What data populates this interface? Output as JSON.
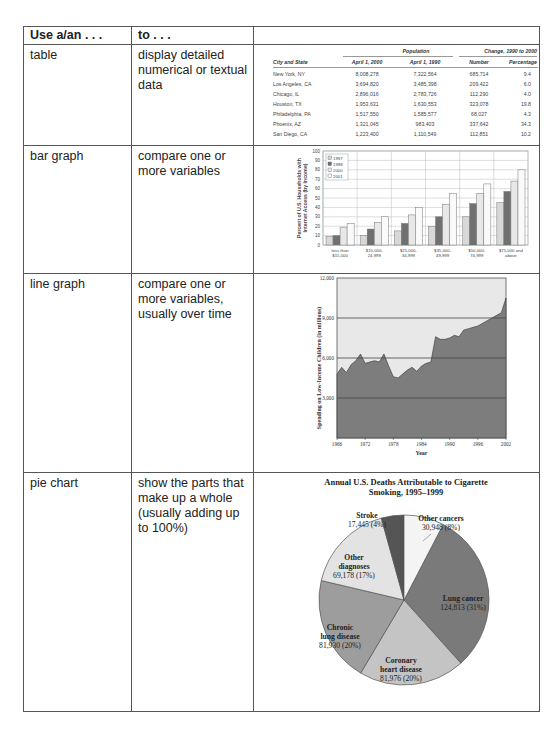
{
  "header": {
    "col1": "Use a/an . . .",
    "col2": "to . . .",
    "col3": ""
  },
  "rows": [
    {
      "use": "table",
      "to": "display detailed numerical or textual data"
    },
    {
      "use": "bar graph",
      "to": "compare one or more variables"
    },
    {
      "use": "line graph",
      "to": "compare one or more variables, usually over time"
    },
    {
      "use": "pie chart",
      "to": "show the parts that make up a whole (usually adding up to 100%)"
    }
  ],
  "example_table": {
    "group_headers": {
      "population": "Population",
      "change": "Change, 1990 to 2000"
    },
    "columns": [
      "City and State",
      "April 1, 2000",
      "April 1, 1990",
      "Number",
      "Percentage"
    ],
    "rows": [
      [
        "New York, NY",
        "8,008,278",
        "7,322,564",
        "685,714",
        "9.4"
      ],
      [
        "Los Angeles, CA",
        "3,694,820",
        "3,485,398",
        "209,422",
        "6.0"
      ],
      [
        "Chicago, IL",
        "2,896,016",
        "2,783,726",
        "112,290",
        "4.0"
      ],
      [
        "Houston, TX",
        "1,953,631",
        "1,630,553",
        "323,078",
        "19.8"
      ],
      [
        "Philadelphia, PA",
        "1,517,550",
        "1,585,577",
        "68,027",
        "4.3"
      ],
      [
        "Phoenix, AZ",
        "1,321,045",
        "983,403",
        "337,642",
        "34.3"
      ],
      [
        "San Diego, CA",
        "1,223,400",
        "1,110,549",
        "112,851",
        "10.2"
      ]
    ]
  },
  "chart_data": [
    {
      "type": "bar",
      "title": "",
      "ylabel": "Percent of U.S. Households with Internet Access (by Income)",
      "xlabel": "",
      "ylim": [
        0,
        100
      ],
      "yticks": [
        0,
        10,
        20,
        30,
        40,
        50,
        60,
        70,
        80,
        90,
        100
      ],
      "categories": [
        "less than $15,000",
        "$15,000-24,999",
        "$25,000-34,999",
        "$35,000-49,999",
        "$50,000-74,999",
        "$75,000 and above"
      ],
      "series": [
        {
          "name": "1997",
          "color": "#d8d8d8",
          "values": [
            9,
            10,
            15,
            20,
            30,
            45
          ]
        },
        {
          "name": "1998",
          "color": "#707070",
          "values": [
            10,
            17,
            23,
            30,
            44,
            57
          ]
        },
        {
          "name": "2000",
          "color": "#e8e8e8",
          "values": [
            19,
            24,
            32,
            43,
            55,
            68
          ]
        },
        {
          "name": "2001",
          "color": "#fafafa",
          "values": [
            23,
            30,
            40,
            55,
            65,
            80
          ]
        }
      ],
      "legend_position": "upper-left inside",
      "grid": true
    },
    {
      "type": "area",
      "title": "",
      "ylabel": "Spending on Low-Income Children (in millions)",
      "xlabel": "Year",
      "ylim": [
        0,
        12000
      ],
      "yticks": [
        "3,000",
        "6,000",
        "9,000",
        "12,000"
      ],
      "xticks": [
        "1966",
        "1972",
        "1978",
        "1984",
        "1990",
        "1996",
        "2002"
      ],
      "x": [
        1966,
        1967,
        1968,
        1969,
        1970,
        1971,
        1972,
        1973,
        1974,
        1975,
        1976,
        1977,
        1978,
        1979,
        1980,
        1981,
        1982,
        1983,
        1984,
        1985,
        1986,
        1987,
        1988,
        1989,
        1990,
        1991,
        1992,
        1993,
        1994,
        1995,
        1996,
        1997,
        1998,
        1999,
        2000,
        2001,
        2002
      ],
      "values": [
        4800,
        5300,
        4900,
        5500,
        5800,
        6300,
        5600,
        5700,
        5800,
        5700,
        6300,
        5400,
        4600,
        4500,
        4800,
        5100,
        5300,
        5000,
        5400,
        5600,
        5700,
        7600,
        7400,
        7400,
        7500,
        7700,
        7600,
        8100,
        8200,
        8300,
        8400,
        8600,
        8800,
        9000,
        9200,
        9400,
        10500
      ],
      "grid": true
    },
    {
      "type": "pie",
      "title": "Annual U.S. Deaths Attributable to Cigarette Smoking, 1995–1999",
      "slices": [
        {
          "label": "Lung cancer",
          "value": 124813,
          "percent": "31%",
          "display": "124,813 (31%)",
          "color": "#7a7a7a"
        },
        {
          "label": "Coronary heart disease",
          "value": 81976,
          "percent": "20%",
          "display": "81,976 (20%)",
          "color": "#c4c4c4"
        },
        {
          "label": "Chronic lung disease",
          "value": 81930,
          "percent": "20%",
          "display": "81,930 (20%)",
          "color": "#9d9d9d"
        },
        {
          "label": "Other diagnoses",
          "value": 69178,
          "percent": "17%",
          "display": "69,178 (17%)",
          "color": "#e3e3e3"
        },
        {
          "label": "Stroke",
          "value": 17445,
          "percent": "4%",
          "display": "17,445 (4%)",
          "color": "#555555"
        },
        {
          "label": "Other cancers",
          "value": 30948,
          "percent": "8%",
          "display": "30,948 (8%)",
          "color": "#f4f4f4"
        }
      ]
    }
  ]
}
